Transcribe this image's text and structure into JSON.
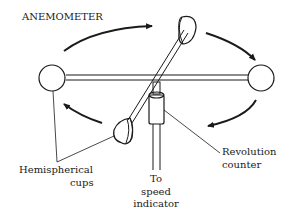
{
  "diagram": {
    "title": "ANEMOMETER",
    "labels": {
      "cups_line1": "Hemispherical",
      "cups_line2": "cups",
      "to_line1": "To",
      "to_line2": "speed",
      "to_line3": "indicator",
      "counter_line1": "Revolution",
      "counter_line2": "counter"
    },
    "colors": {
      "ink": "#1a1a1a",
      "background": "#ffffff"
    },
    "components": [
      "hemispherical-cup",
      "hemispherical-cup",
      "hemispherical-cup",
      "hemispherical-cup",
      "cross-arms",
      "revolution-counter",
      "shaft"
    ],
    "rotation_direction": "clockwise (viewed from above)"
  }
}
